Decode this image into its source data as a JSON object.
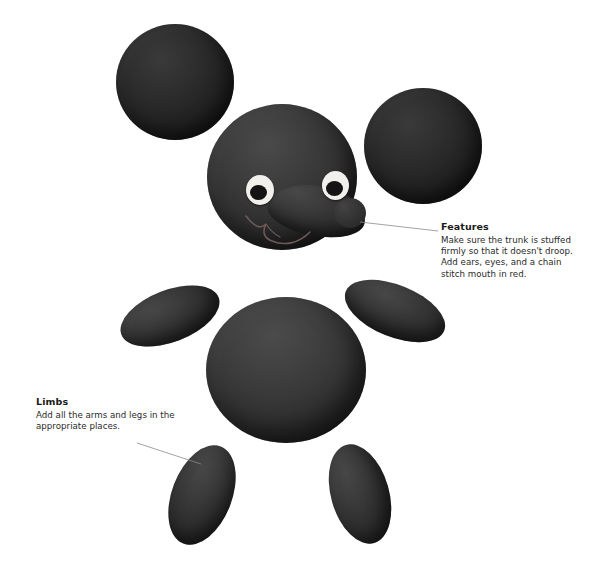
{
  "page": {
    "background_color": "#ffffff",
    "width": 615,
    "height": 577
  },
  "figure": {
    "part_color": "#3a3a3a",
    "ear_color": "#282828",
    "eye_white_color": "#f2f0ec",
    "pupil_color": "#141414",
    "leader_line_color": "#8a8a8a",
    "parts": [
      {
        "name": "ear-left",
        "shape": "circle"
      },
      {
        "name": "ear-right",
        "shape": "circle"
      },
      {
        "name": "head",
        "shape": "circle"
      },
      {
        "name": "trunk",
        "shape": "rounded-snout"
      },
      {
        "name": "eye-left",
        "shape": "oval"
      },
      {
        "name": "eye-right",
        "shape": "oval"
      },
      {
        "name": "mouth",
        "shape": "chain-stitch-curve"
      },
      {
        "name": "body",
        "shape": "circle"
      },
      {
        "name": "arm-left",
        "shape": "oval"
      },
      {
        "name": "arm-right",
        "shape": "oval"
      },
      {
        "name": "leg-left",
        "shape": "oval"
      },
      {
        "name": "leg-right",
        "shape": "oval"
      }
    ]
  },
  "callouts": {
    "features": {
      "title": "Features",
      "line1": "Make sure the trunk is stuffed",
      "line2": "firmly so that it doesn't droop.",
      "line3": "Add ears, eyes, and a chain",
      "line4": "stitch mouth in red."
    },
    "limbs": {
      "title": "Limbs",
      "line1": "Add all the arms and legs in the",
      "line2": "appropriate places."
    }
  }
}
